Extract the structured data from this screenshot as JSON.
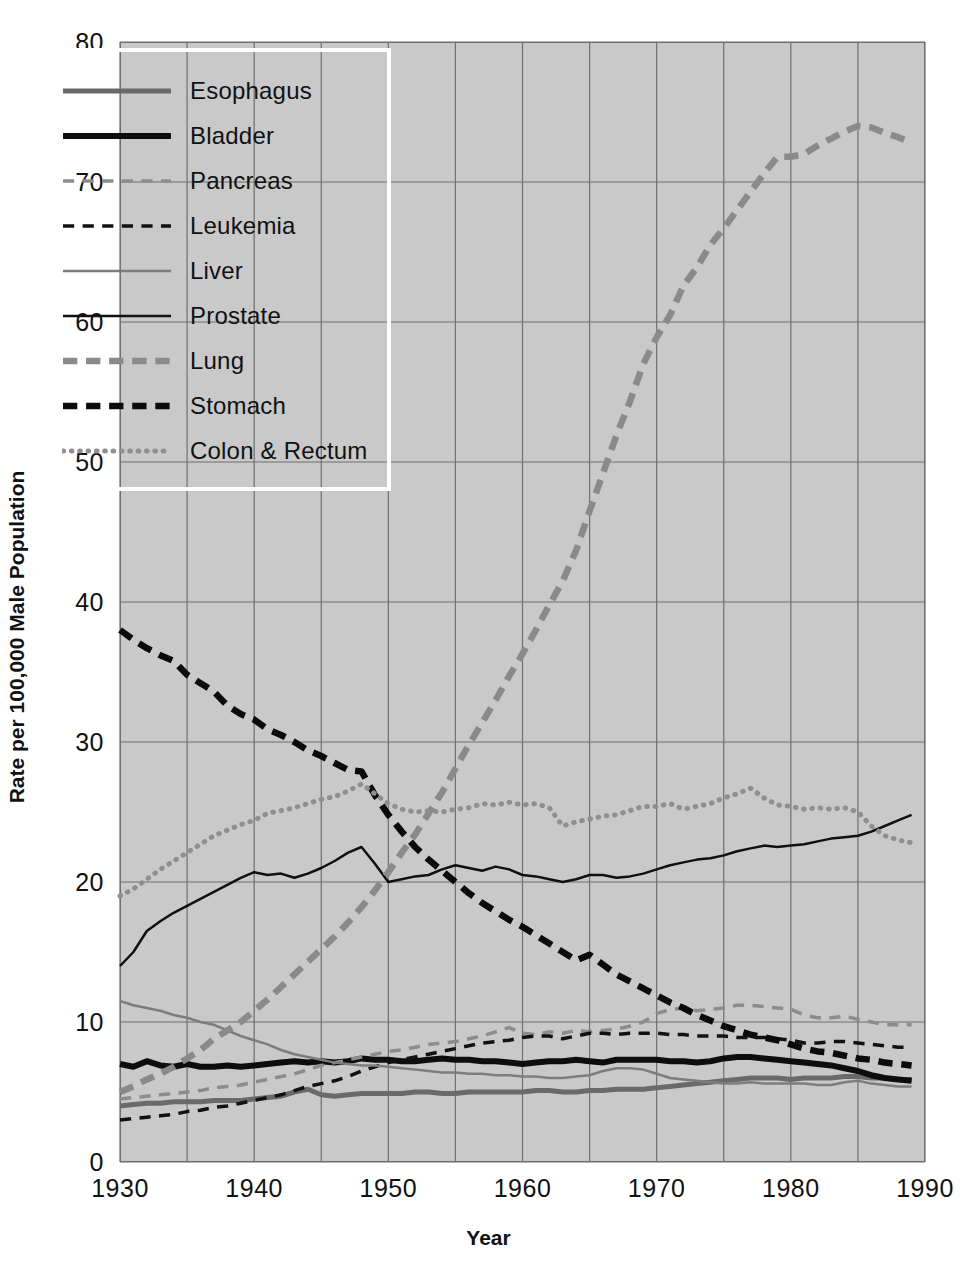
{
  "chart_data": {
    "type": "line",
    "title": "",
    "xlabel": "Year",
    "ylabel": "Rate per 100,000 Male Population",
    "xlim": [
      1930,
      1990
    ],
    "ylim": [
      0,
      80
    ],
    "xticks": [
      1930,
      1940,
      1950,
      1960,
      1970,
      1980,
      1990
    ],
    "yticks": [
      0,
      10,
      20,
      30,
      40,
      50,
      60,
      70,
      80
    ],
    "grid": true,
    "grid_x_step": 5,
    "grid_y_step": 10,
    "legend_position": "top-left",
    "plot_background": "#c9c9c9",
    "x": [
      1930,
      1931,
      1932,
      1933,
      1934,
      1935,
      1936,
      1937,
      1938,
      1939,
      1940,
      1941,
      1942,
      1943,
      1944,
      1945,
      1946,
      1947,
      1948,
      1949,
      1950,
      1951,
      1952,
      1953,
      1954,
      1955,
      1956,
      1957,
      1958,
      1959,
      1960,
      1961,
      1962,
      1963,
      1964,
      1965,
      1966,
      1967,
      1968,
      1969,
      1970,
      1971,
      1972,
      1973,
      1974,
      1975,
      1976,
      1977,
      1978,
      1979,
      1980,
      1981,
      1982,
      1983,
      1984,
      1985,
      1986,
      1987,
      1988,
      1989
    ],
    "series": [
      {
        "name": "Esophagus",
        "color": "#6a6a6a",
        "style": "solid",
        "width": 5,
        "values": [
          4.0,
          4.1,
          4.2,
          4.2,
          4.3,
          4.3,
          4.3,
          4.4,
          4.4,
          4.4,
          4.5,
          4.6,
          4.7,
          5.0,
          5.2,
          4.8,
          4.7,
          4.8,
          4.9,
          4.9,
          4.9,
          4.9,
          5.0,
          5.0,
          4.9,
          4.9,
          5.0,
          5.0,
          5.0,
          5.0,
          5.0,
          5.1,
          5.1,
          5.0,
          5.0,
          5.1,
          5.1,
          5.2,
          5.2,
          5.2,
          5.3,
          5.4,
          5.5,
          5.6,
          5.7,
          5.8,
          5.9,
          6.0,
          6.0,
          6.0,
          5.9,
          6.0,
          6.0,
          6.0,
          6.1,
          6.1,
          6.0,
          6.0,
          5.9,
          5.9
        ]
      },
      {
        "name": "Bladder",
        "color": "#0d0d0d",
        "style": "solid",
        "width": 6,
        "values": [
          7.0,
          6.8,
          7.2,
          6.9,
          6.8,
          7.0,
          6.8,
          6.8,
          6.9,
          6.8,
          6.9,
          7.0,
          7.1,
          7.2,
          7.1,
          7.2,
          7.1,
          7.2,
          7.4,
          7.3,
          7.3,
          7.2,
          7.2,
          7.3,
          7.4,
          7.3,
          7.3,
          7.2,
          7.2,
          7.1,
          7.0,
          7.1,
          7.2,
          7.2,
          7.3,
          7.2,
          7.1,
          7.3,
          7.3,
          7.3,
          7.3,
          7.2,
          7.2,
          7.1,
          7.2,
          7.4,
          7.5,
          7.5,
          7.4,
          7.3,
          7.2,
          7.1,
          7.0,
          6.9,
          6.7,
          6.5,
          6.2,
          6.0,
          5.9,
          5.8
        ]
      },
      {
        "name": "Pancreas",
        "color": "#8c8c8c",
        "style": "dashed",
        "width": 3.5,
        "values": [
          4.5,
          4.6,
          4.7,
          4.8,
          4.9,
          5.0,
          5.1,
          5.3,
          5.4,
          5.5,
          5.7,
          5.9,
          6.1,
          6.3,
          6.6,
          6.9,
          7.1,
          7.3,
          7.5,
          7.7,
          7.9,
          8.0,
          8.2,
          8.4,
          8.5,
          8.6,
          8.8,
          9.0,
          9.3,
          9.6,
          9.2,
          9.1,
          9.3,
          9.2,
          9.4,
          9.3,
          9.4,
          9.5,
          9.7,
          10.0,
          10.6,
          10.9,
          11.0,
          10.8,
          10.9,
          11.0,
          11.2,
          11.2,
          11.1,
          11.0,
          10.9,
          10.5,
          10.3,
          10.3,
          10.4,
          10.2,
          10.0,
          9.8,
          9.8,
          9.8
        ]
      },
      {
        "name": "Leukemia",
        "color": "#111111",
        "style": "dashed",
        "width": 3.5,
        "values": [
          3.0,
          3.1,
          3.2,
          3.3,
          3.4,
          3.6,
          3.7,
          3.9,
          4.0,
          4.2,
          4.4,
          4.6,
          4.8,
          5.1,
          5.4,
          5.6,
          5.8,
          6.1,
          6.5,
          6.8,
          7.1,
          7.3,
          7.5,
          7.7,
          7.9,
          8.1,
          8.3,
          8.5,
          8.6,
          8.7,
          8.9,
          9.0,
          9.0,
          8.8,
          9.0,
          9.2,
          9.2,
          9.1,
          9.2,
          9.2,
          9.2,
          9.1,
          9.1,
          9.0,
          9.0,
          9.0,
          8.9,
          8.9,
          8.9,
          8.8,
          8.7,
          8.5,
          8.5,
          8.6,
          8.6,
          8.5,
          8.4,
          8.3,
          8.2,
          8.2
        ]
      },
      {
        "name": "Liver",
        "color": "#7d7d7d",
        "style": "solid",
        "width": 2.5,
        "values": [
          11.5,
          11.2,
          11.0,
          10.8,
          10.5,
          10.3,
          10.0,
          9.8,
          9.4,
          9.0,
          8.7,
          8.4,
          8.0,
          7.7,
          7.5,
          7.3,
          7.1,
          7.0,
          6.9,
          6.9,
          6.8,
          6.7,
          6.6,
          6.5,
          6.4,
          6.4,
          6.3,
          6.3,
          6.2,
          6.2,
          6.1,
          6.1,
          6.0,
          6.0,
          6.1,
          6.2,
          6.5,
          6.7,
          6.7,
          6.6,
          6.3,
          6.0,
          5.9,
          5.8,
          5.7,
          5.6,
          5.6,
          5.7,
          5.6,
          5.6,
          5.6,
          5.6,
          5.5,
          5.5,
          5.7,
          5.8,
          5.6,
          5.5,
          5.4,
          5.4
        ]
      },
      {
        "name": "Prostate",
        "color": "#101010",
        "style": "solid",
        "width": 2.5,
        "values": [
          14.0,
          15.0,
          16.5,
          17.2,
          17.8,
          18.3,
          18.8,
          19.3,
          19.8,
          20.3,
          20.7,
          20.5,
          20.6,
          20.3,
          20.6,
          21.0,
          21.5,
          22.1,
          22.5,
          21.3,
          20.0,
          20.2,
          20.4,
          20.5,
          20.9,
          21.2,
          21.0,
          20.8,
          21.1,
          20.9,
          20.5,
          20.4,
          20.2,
          20.0,
          20.2,
          20.5,
          20.5,
          20.3,
          20.4,
          20.6,
          20.9,
          21.2,
          21.4,
          21.6,
          21.7,
          21.9,
          22.2,
          22.4,
          22.6,
          22.5,
          22.6,
          22.7,
          22.9,
          23.1,
          23.2,
          23.3,
          23.6,
          24.0,
          24.4,
          24.8
        ]
      },
      {
        "name": "Lung",
        "color": "#8a8a8a",
        "style": "dashed-heavy",
        "width": 6.5,
        "values": [
          5.0,
          5.4,
          5.9,
          6.3,
          6.8,
          7.4,
          8.0,
          8.8,
          9.4,
          10.0,
          10.8,
          11.6,
          12.5,
          13.4,
          14.3,
          15.2,
          16.1,
          17.1,
          18.2,
          19.4,
          20.7,
          22.1,
          23.4,
          24.9,
          26.4,
          28.1,
          29.8,
          31.4,
          33.0,
          34.7,
          36.3,
          38.0,
          39.8,
          41.5,
          43.7,
          46.5,
          49.2,
          51.9,
          54.3,
          57.0,
          58.9,
          60.5,
          62.6,
          63.9,
          65.5,
          66.7,
          68.0,
          69.3,
          70.6,
          71.8,
          71.8,
          72.0,
          72.6,
          73.1,
          73.6,
          74.0,
          73.9,
          73.5,
          73.2,
          72.8
        ]
      },
      {
        "name": "Stomach",
        "color": "#0b0b0b",
        "style": "dashed-heavy",
        "width": 6.5,
        "values": [
          38.0,
          37.3,
          36.7,
          36.2,
          35.8,
          34.8,
          34.2,
          33.6,
          32.6,
          32.0,
          31.6,
          30.9,
          30.5,
          30.0,
          29.4,
          29.0,
          28.5,
          28.0,
          27.9,
          26.2,
          24.8,
          23.6,
          22.5,
          21.6,
          20.8,
          20.0,
          19.2,
          18.5,
          17.9,
          17.3,
          16.8,
          16.2,
          15.6,
          15.0,
          14.4,
          14.8,
          14.1,
          13.4,
          12.9,
          12.4,
          11.9,
          11.4,
          11.0,
          10.5,
          10.1,
          9.7,
          9.4,
          9.1,
          8.9,
          8.7,
          8.4,
          8.1,
          7.9,
          7.8,
          7.6,
          7.4,
          7.3,
          7.1,
          7.0,
          6.9
        ]
      },
      {
        "name": "Colon & Rectum",
        "color": "#8f8f8f",
        "style": "dotted",
        "width": 5,
        "values": [
          19.0,
          19.5,
          20.2,
          20.9,
          21.5,
          22.1,
          22.7,
          23.3,
          23.7,
          24.1,
          24.4,
          24.9,
          25.1,
          25.3,
          25.6,
          25.9,
          26.1,
          26.5,
          27.0,
          26.3,
          25.6,
          25.2,
          25.0,
          25.1,
          25.0,
          25.2,
          25.3,
          25.6,
          25.5,
          25.7,
          25.5,
          25.6,
          25.3,
          24.0,
          24.3,
          24.5,
          24.7,
          24.8,
          25.1,
          25.4,
          25.4,
          25.6,
          25.2,
          25.4,
          25.6,
          26.0,
          26.3,
          26.7,
          26.0,
          25.5,
          25.4,
          25.2,
          25.3,
          25.2,
          25.3,
          25.0,
          24.0,
          23.3,
          23.0,
          22.8
        ]
      }
    ]
  },
  "axes": {
    "yticks": [
      "0",
      "10",
      "20",
      "30",
      "40",
      "50",
      "60",
      "70",
      "80"
    ],
    "xticks": [
      "1930",
      "1940",
      "1950",
      "1960",
      "1970",
      "1980",
      "1990"
    ],
    "xlabel": "Year",
    "ylabel": "Rate per 100,000 Male Population"
  },
  "legend": {
    "items": [
      {
        "label": "Esophagus"
      },
      {
        "label": "Bladder"
      },
      {
        "label": "Pancreas"
      },
      {
        "label": "Leukemia"
      },
      {
        "label": "Liver"
      },
      {
        "label": "Prostate"
      },
      {
        "label": "Lung"
      },
      {
        "label": "Stomach"
      },
      {
        "label": "Colon & Rectum"
      }
    ]
  }
}
